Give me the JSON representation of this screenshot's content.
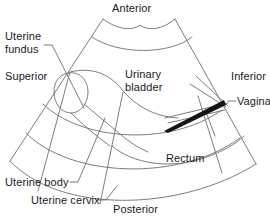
{
  "figure": {
    "type": "anatomical-ultrasound-diagram",
    "background_color": "#ffffff",
    "line_color": "#6e6e6e",
    "text_color": "#1a1a1a",
    "vagina_fill_color": "#141414"
  },
  "orientation_labels": {
    "anterior": "Anterior",
    "posterior": "Posterior",
    "superior": "Superior",
    "inferior": "Inferior"
  },
  "structure_labels": {
    "uterine_fundus": "Uterine\nfundus",
    "uterine_fundus_line1": "Uterine",
    "uterine_fundus_line2": "fundus",
    "urinary_bladder_line1": "Urinary",
    "urinary_bladder_line2": "bladder",
    "vagina": "Vagina",
    "rectum": "Rectum",
    "uterine_body": "Uterine body",
    "uterine_cervix": "Uterine cervix"
  }
}
